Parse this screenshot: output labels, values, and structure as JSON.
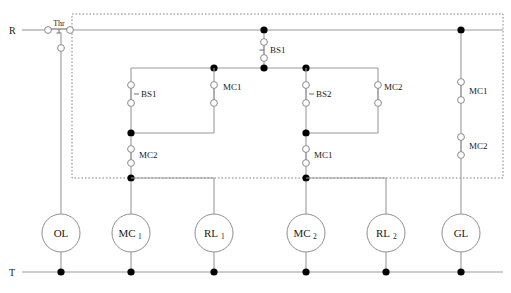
{
  "diagram": {
    "rails": {
      "top_label": "R",
      "bottom_label": "T"
    },
    "protection": {
      "label": "Thr",
      "type": "thermal-overload-contact"
    },
    "enclosure": {
      "style": "dotted",
      "note": "control-panel boundary"
    },
    "contacts": [
      {
        "id": "c-stop-bs1",
        "label": "BS1",
        "kind": "nc-pushbutton"
      },
      {
        "id": "c-start-bs1",
        "label": "BS1",
        "kind": "no-pushbutton"
      },
      {
        "id": "c-seal-mc1",
        "label": "MC1",
        "kind": "no-contact"
      },
      {
        "id": "c-ilk-mc2",
        "label": "MC2",
        "kind": "nc-contact"
      },
      {
        "id": "c-start-bs2",
        "label": "BS2",
        "kind": "no-pushbutton"
      },
      {
        "id": "c-seal-mc2",
        "label": "MC2",
        "kind": "no-contact"
      },
      {
        "id": "c-ilk-mc1",
        "label": "MC1",
        "kind": "nc-contact"
      },
      {
        "id": "c-gl-mc1",
        "label": "MC1",
        "kind": "nc-contact"
      },
      {
        "id": "c-gl-mc2",
        "label": "MC2",
        "kind": "nc-contact"
      }
    ],
    "coils": [
      {
        "id": "coil-ol",
        "base": "OL",
        "sub": "",
        "name": "orange-lamp"
      },
      {
        "id": "coil-mc1",
        "base": "MC",
        "sub": "1",
        "name": "contactor-1-coil"
      },
      {
        "id": "coil-rl1",
        "base": "RL",
        "sub": "1",
        "name": "red-lamp-1"
      },
      {
        "id": "coil-mc2",
        "base": "MC",
        "sub": "2",
        "name": "contactor-2-coil"
      },
      {
        "id": "coil-rl2",
        "base": "RL",
        "sub": "2",
        "name": "red-lamp-2"
      },
      {
        "id": "coil-gl",
        "base": "GL",
        "sub": "",
        "name": "green-lamp"
      }
    ],
    "colors": {
      "wire": "#9a9a9a",
      "node": "#000000",
      "text": "#1a1a1a",
      "box": "#777777",
      "background": "#ffffff"
    }
  }
}
